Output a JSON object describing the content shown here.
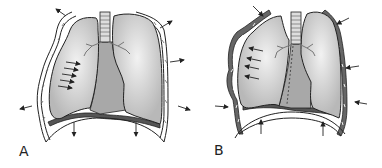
{
  "figure": {
    "panels": [
      {
        "label": "A",
        "phase": "inspiration",
        "arrow_direction": "outward",
        "colors": {
          "lung": "#c8c8c8",
          "lung_highlight": "#eeeeee",
          "outline": "#222222",
          "mediastinum": "#a8a8a8",
          "pleura": "#888888"
        }
      },
      {
        "label": "B",
        "phase": "expiration",
        "arrow_direction": "inward",
        "colors": {
          "lung": "#c8c8c8",
          "lung_highlight": "#eeeeee",
          "outline": "#222222",
          "mediastinum": "#a8a8a8",
          "pleura": "#777777"
        }
      }
    ]
  }
}
